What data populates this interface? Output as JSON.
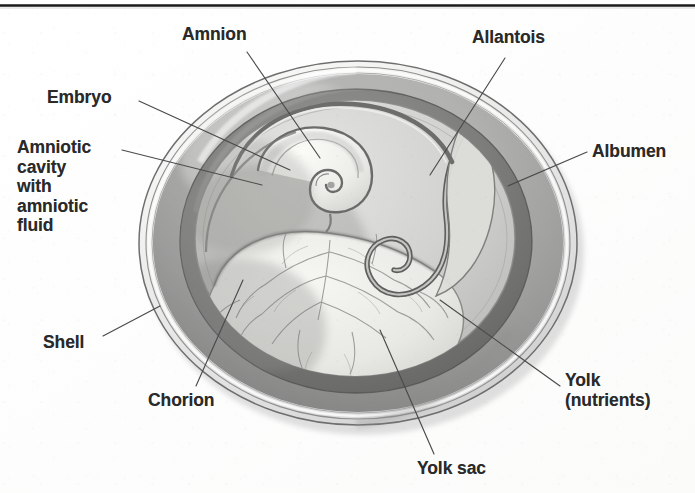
{
  "figure": {
    "style": "grayscale scanned textbook illustration",
    "background_color": "#fdfdfc",
    "text_color": "#2a2a2a",
    "border": {
      "top_rule_color": "#1a1a1a",
      "top_rule_y": 5
    },
    "egg": {
      "center_x": 358,
      "center_y": 243,
      "radius_x": 219,
      "radius_y": 182,
      "shell_color": "#8d8d8d",
      "membrane_color": "#f4f4f2",
      "albumen_color": "#a8a8a8",
      "chorion_color": "#6f6f6f",
      "amniotic_cavity_color": "#d9d9d7",
      "yolk_color": "#e9e9e6",
      "embryo_color": "#efeeea"
    }
  },
  "labels": [
    {
      "id": "amnion",
      "text": "Amnion",
      "x": 182,
      "y": 25,
      "align": "left",
      "leader": {
        "x1": 247,
        "y1": 52,
        "x2": 320,
        "y2": 158
      }
    },
    {
      "id": "allantois",
      "text": "Allantois",
      "x": 472,
      "y": 28,
      "align": "left",
      "leader": {
        "x1": 505,
        "y1": 58,
        "x2": 430,
        "y2": 175
      }
    },
    {
      "id": "embryo",
      "text": "Embryo",
      "x": 47,
      "y": 88,
      "align": "left",
      "leader": {
        "x1": 139,
        "y1": 101,
        "x2": 290,
        "y2": 170
      }
    },
    {
      "id": "albumen",
      "text": "Albumen",
      "x": 592,
      "y": 142,
      "align": "left",
      "leader": {
        "x1": 587,
        "y1": 152,
        "x2": 508,
        "y2": 186
      }
    },
    {
      "id": "amniotic-cavity",
      "text": "Amniotic\ncavity\nwith\namniotic\nfluid",
      "x": 17,
      "y": 138,
      "align": "left",
      "leader": {
        "x1": 122,
        "y1": 150,
        "x2": 262,
        "y2": 185
      }
    },
    {
      "id": "shell",
      "text": "Shell",
      "x": 43,
      "y": 333,
      "align": "left",
      "leader": {
        "x1": 103,
        "y1": 336,
        "x2": 160,
        "y2": 306
      }
    },
    {
      "id": "chorion",
      "text": "Chorion",
      "x": 148,
      "y": 391,
      "align": "left",
      "leader": {
        "x1": 196,
        "y1": 386,
        "x2": 243,
        "y2": 280
      }
    },
    {
      "id": "yolk-nutrients",
      "text": "Yolk\n(nutrients)",
      "x": 565,
      "y": 371,
      "align": "left",
      "leader": {
        "x1": 560,
        "y1": 386,
        "x2": 440,
        "y2": 300
      }
    },
    {
      "id": "yolk-sac",
      "text": "Yolk sac",
      "x": 417,
      "y": 459,
      "align": "left",
      "leader": {
        "x1": 434,
        "y1": 454,
        "x2": 380,
        "y2": 330
      }
    }
  ],
  "leader_line": {
    "color": "#4a4a4a",
    "width": 1.15
  }
}
